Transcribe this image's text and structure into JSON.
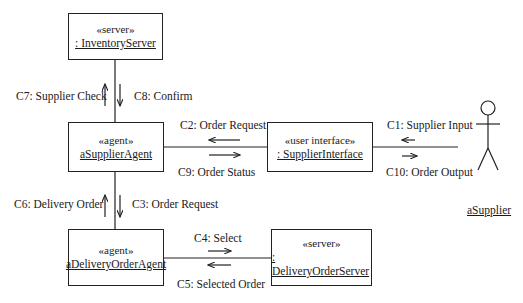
{
  "diagram": {
    "type": "UML communication diagram",
    "objects": [
      {
        "id": "inventory_server",
        "stereotype": "«server»",
        "name": ": InventoryServer"
      },
      {
        "id": "supplier_agent",
        "stereotype": "«agent»",
        "name": "aSupplierAgent"
      },
      {
        "id": "supplier_interface",
        "stereotype": "«user interface»",
        "name": ": SupplierInterface"
      },
      {
        "id": "delivery_order_agent",
        "stereotype": "«agent»",
        "name": "aDeliveryOrderAgent"
      },
      {
        "id": "delivery_order_server",
        "stereotype": "«server»",
        "name": ": DeliveryOrderServer"
      }
    ],
    "actor": {
      "name": "aSupplier"
    },
    "messages": {
      "c1": "C1: Supplier Input",
      "c2": "C2: Order Request",
      "c3": "C3: Order Request",
      "c4": "C4: Select",
      "c5": "C5: Selected Order",
      "c6": "C6: Delivery Order",
      "c7": "C7: Supplier Check",
      "c8": "C8: Confirm",
      "c9": "C9: Order Status",
      "c10": "C10: Order Output"
    }
  }
}
